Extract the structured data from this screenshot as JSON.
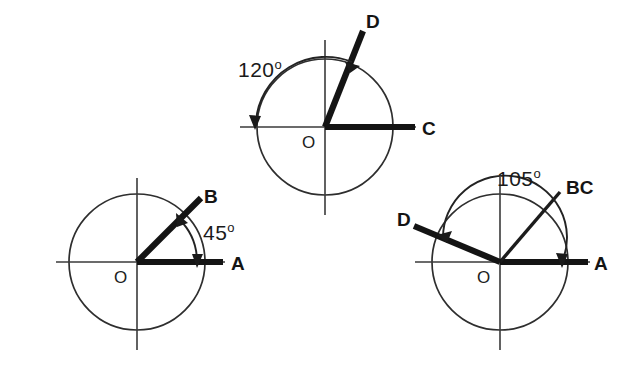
{
  "figure": {
    "background_color": "#ffffff",
    "ink_color": "#1a1a1a",
    "diagrams": [
      {
        "id": "diagram-45",
        "center": {
          "x": 137,
          "y": 262
        },
        "radius": 68,
        "angle_value": "45",
        "degree_symbol": "o",
        "angle_label_full": "45o",
        "origin_label": "O",
        "rays": [
          {
            "name": "ray-OA",
            "label": "A",
            "angle_deg": 0,
            "weight": "thick",
            "length": 88
          },
          {
            "name": "ray-OB",
            "label": "B",
            "angle_deg": 45,
            "weight": "thick",
            "length": 88
          }
        ],
        "arc": {
          "from_deg": 0,
          "to_deg": 45,
          "arrows": "both",
          "radius": 62
        }
      },
      {
        "id": "diagram-120",
        "center": {
          "x": 325,
          "y": 127
        },
        "radius": 68,
        "angle_value": "120",
        "degree_symbol": "o",
        "angle_label_full": "120o",
        "origin_label": "O",
        "rays": [
          {
            "name": "ray-OC",
            "label": "C",
            "angle_deg": 0,
            "weight": "thick",
            "length": 90
          },
          {
            "name": "ray-OD",
            "label": "D",
            "angle_deg": 72,
            "weight": "thick",
            "length": 92
          }
        ],
        "arc": {
          "from_deg": 72,
          "to_deg": 180,
          "arrows": "both",
          "radius": 70
        }
      },
      {
        "id": "diagram-105",
        "center": {
          "x": 500,
          "y": 262
        },
        "radius": 68,
        "angle_value": "105",
        "degree_symbol": "o",
        "angle_label_full": "105o",
        "origin_label": "O",
        "rays": [
          {
            "name": "ray-OA",
            "label": "A",
            "angle_deg": 0,
            "weight": "thick",
            "length": 88
          },
          {
            "name": "ray-OBC",
            "label": "BC",
            "angle_deg": 50,
            "weight": "thin",
            "length": 92
          },
          {
            "name": "ray-OD",
            "label": "D",
            "angle_deg": 158,
            "weight": "thick",
            "length": 92
          }
        ],
        "arc": {
          "from_deg": 0,
          "to_deg": 158,
          "arrows": "both",
          "radius": 62
        }
      }
    ]
  },
  "labels": {
    "a1": "A",
    "b1": "B",
    "o1": "O",
    "angle1": "45",
    "c2": "C",
    "d2": "D",
    "o2": "O",
    "angle2": "120",
    "a3": "A",
    "bc3": "BC",
    "d3": "D",
    "o3": "O",
    "angle3": "105",
    "degree": "o"
  }
}
